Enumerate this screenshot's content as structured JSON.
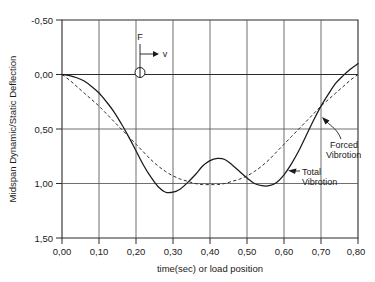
{
  "chart_data": {
    "type": "line",
    "title": "",
    "xlabel": "time(sec)  or  load  position",
    "ylabel": "Midspan  Dynamic/Static  Deflection",
    "xlim": [
      0.0,
      0.8
    ],
    "ylim": [
      -0.5,
      1.5
    ],
    "y_axis_inverted": true,
    "grid": true,
    "legend_position": "inline-annotations",
    "xticks": [
      "0,00",
      "0,10",
      "0,20",
      "0,30",
      "0,40",
      "0,50",
      "0,60",
      "0,70",
      "0,80"
    ],
    "xtick_values": [
      0.0,
      0.1,
      0.2,
      0.3,
      0.4,
      0.5,
      0.6,
      0.7,
      0.8
    ],
    "yticks": [
      "-0,50",
      "0,00",
      "0,50",
      "1,00",
      "1,50"
    ],
    "ytick_values": [
      -0.5,
      0.0,
      0.5,
      1.0,
      1.5
    ],
    "series": [
      {
        "name": "Total Vibration",
        "style": "solid",
        "color": "#1a1a1a",
        "x": [
          0.0,
          0.02,
          0.04,
          0.06,
          0.08,
          0.1,
          0.12,
          0.14,
          0.16,
          0.18,
          0.2,
          0.22,
          0.24,
          0.26,
          0.28,
          0.3,
          0.32,
          0.34,
          0.36,
          0.38,
          0.4,
          0.42,
          0.44,
          0.46,
          0.48,
          0.5,
          0.52,
          0.54,
          0.56,
          0.58,
          0.6,
          0.62,
          0.64,
          0.66,
          0.68,
          0.7,
          0.72,
          0.74,
          0.76,
          0.78,
          0.8
        ],
        "values": [
          0.0,
          0.01,
          0.03,
          0.06,
          0.11,
          0.17,
          0.25,
          0.34,
          0.45,
          0.57,
          0.7,
          0.83,
          0.94,
          1.03,
          1.08,
          1.08,
          1.05,
          0.99,
          0.92,
          0.84,
          0.79,
          0.77,
          0.78,
          0.83,
          0.89,
          0.95,
          1.0,
          1.02,
          1.02,
          0.99,
          0.92,
          0.82,
          0.7,
          0.56,
          0.42,
          0.29,
          0.18,
          0.08,
          0.01,
          -0.05,
          -0.1
        ]
      },
      {
        "name": "Forced Vibration",
        "style": "dashed",
        "color": "#2b2b2b",
        "x": [
          0.0,
          0.02,
          0.04,
          0.06,
          0.08,
          0.1,
          0.12,
          0.14,
          0.16,
          0.18,
          0.2,
          0.22,
          0.24,
          0.26,
          0.28,
          0.3,
          0.32,
          0.34,
          0.36,
          0.38,
          0.4,
          0.42,
          0.44,
          0.46,
          0.48,
          0.5,
          0.52,
          0.54,
          0.56,
          0.58,
          0.6,
          0.62,
          0.64,
          0.66,
          0.68,
          0.7,
          0.72,
          0.74,
          0.76,
          0.78,
          0.8
        ],
        "values": [
          0.0,
          0.05,
          0.11,
          0.17,
          0.23,
          0.29,
          0.36,
          0.43,
          0.5,
          0.57,
          0.64,
          0.71,
          0.78,
          0.84,
          0.89,
          0.93,
          0.96,
          0.98,
          1.0,
          1.01,
          1.01,
          1.01,
          1.0,
          0.98,
          0.96,
          0.93,
          0.89,
          0.84,
          0.78,
          0.71,
          0.64,
          0.57,
          0.5,
          0.43,
          0.36,
          0.29,
          0.23,
          0.17,
          0.11,
          0.05,
          0.0
        ]
      }
    ],
    "annotations": [
      {
        "name": "forced-vibration-label",
        "text_line1": "Forced",
        "text_line2": "Vibrotion",
        "points_to_x": 0.7,
        "points_to_y": 0.33
      },
      {
        "name": "total-vibration-label",
        "text_line1": "Total",
        "text_line2": "Vibrotion",
        "points_to_x": 0.615,
        "points_to_y": 0.84
      },
      {
        "name": "force-symbol",
        "text": "F"
      },
      {
        "name": "velocity-symbol",
        "text": "v"
      }
    ]
  }
}
